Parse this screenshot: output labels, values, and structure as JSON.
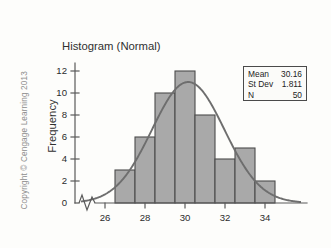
{
  "credit": "Copyright © Cengage Learning 2013",
  "stats": {
    "rows": [
      {
        "label": "Mean",
        "value": "30.16"
      },
      {
        "label": "St Dev",
        "value": "1.811"
      },
      {
        "label": "N",
        "value": "50"
      }
    ]
  },
  "chart_data": {
    "type": "bar",
    "title": "Histogram (Normal)",
    "xlabel": "",
    "ylabel": "Frequency",
    "categories": [
      "26.5-27.5",
      "27.5-28.5",
      "28.5-29.5",
      "29.5-30.5",
      "30.5-31.5",
      "31.5-32.5",
      "32.5-33.5",
      "33.5-34.5"
    ],
    "bin_edges": [
      26.5,
      27.5,
      28.5,
      29.5,
      30.5,
      31.5,
      32.5,
      33.5,
      34.5
    ],
    "values": [
      3,
      6,
      10,
      12,
      8,
      4,
      5,
      2
    ],
    "bar_color": "#a9a9a9",
    "bar_edge_color": "#4c4c4c",
    "curve_color": "#6e6e6e",
    "grid": false,
    "legend": false,
    "axis_break": true,
    "xlim": [
      24.8,
      35.8
    ],
    "ylim": [
      0,
      13
    ],
    "xticks": [
      26,
      28,
      30,
      32,
      34
    ],
    "xticklabels": [
      "26",
      "28",
      "30",
      "32",
      "34"
    ],
    "yticks": [
      0,
      2,
      4,
      6,
      8,
      10,
      12
    ],
    "yticklabels": [
      "0",
      "2",
      "4",
      "6",
      "8",
      "10",
      "12"
    ],
    "overlay_curve": {
      "name": "normal-density",
      "mean": 30.16,
      "sd": 1.811,
      "n": 50,
      "bin_width": 1,
      "peak_frequency": 11.0
    }
  }
}
